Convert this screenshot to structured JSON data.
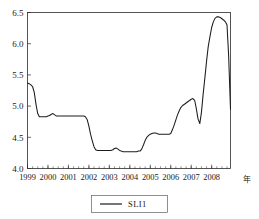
{
  "chart_data": {
    "type": "line",
    "title": "",
    "xlabel": "",
    "ylabel": "",
    "x_unit_label": "年",
    "ylim": [
      4.0,
      6.5
    ],
    "xlim": [
      1999.0,
      2008.92
    ],
    "grid": false,
    "legend_position": "bottom-center",
    "y_ticks": [
      "4.0",
      "4.5",
      "5.0",
      "5.5",
      "6.0",
      "6.5"
    ],
    "y_tick_values": [
      4.0,
      4.5,
      5.0,
      5.5,
      6.0,
      6.5
    ],
    "x_ticks": [
      "1999",
      "2000",
      "2001",
      "2002",
      "2003",
      "2004",
      "2005",
      "2006",
      "2007",
      "2008"
    ],
    "x_tick_values": [
      1999,
      2000,
      2001,
      2002,
      2003,
      2004,
      2005,
      2006,
      2007,
      2008
    ],
    "minor_tick_interval_months": 3,
    "series": [
      {
        "name": "SLI1",
        "color": "#1c1c1c",
        "x": [
          1999.0,
          1999.08,
          1999.17,
          1999.25,
          1999.33,
          1999.42,
          1999.5,
          1999.58,
          1999.67,
          1999.75,
          1999.83,
          1999.92,
          2000.0,
          2000.08,
          2000.17,
          2000.25,
          2000.33,
          2000.42,
          2000.5,
          2000.58,
          2000.67,
          2000.75,
          2000.83,
          2000.92,
          2001.0,
          2001.08,
          2001.17,
          2001.25,
          2001.33,
          2001.42,
          2001.5,
          2001.58,
          2001.67,
          2001.75,
          2001.83,
          2001.92,
          2002.0,
          2002.08,
          2002.17,
          2002.25,
          2002.33,
          2002.42,
          2002.5,
          2002.58,
          2002.67,
          2002.75,
          2002.83,
          2002.92,
          2003.0,
          2003.08,
          2003.17,
          2003.25,
          2003.33,
          2003.42,
          2003.5,
          2003.58,
          2003.67,
          2003.75,
          2003.83,
          2003.92,
          2004.0,
          2004.08,
          2004.17,
          2004.25,
          2004.33,
          2004.42,
          2004.5,
          2004.58,
          2004.67,
          2004.75,
          2004.83,
          2004.92,
          2005.0,
          2005.08,
          2005.17,
          2005.25,
          2005.33,
          2005.42,
          2005.5,
          2005.58,
          2005.67,
          2005.75,
          2005.83,
          2005.92,
          2006.0,
          2006.08,
          2006.17,
          2006.25,
          2006.33,
          2006.42,
          2006.5,
          2006.58,
          2006.67,
          2006.75,
          2006.83,
          2006.92,
          2007.0,
          2007.08,
          2007.17,
          2007.25,
          2007.33,
          2007.42,
          2007.5,
          2007.58,
          2007.67,
          2007.75,
          2007.83,
          2007.92,
          2008.0,
          2008.08,
          2008.17,
          2008.25,
          2008.33,
          2008.42,
          2008.5,
          2008.58,
          2008.67,
          2008.75,
          2008.83,
          2008.92
        ],
        "values": [
          5.37,
          5.36,
          5.34,
          5.31,
          5.22,
          5.02,
          4.88,
          4.83,
          4.83,
          4.83,
          4.83,
          4.83,
          4.84,
          4.85,
          4.87,
          4.88,
          4.86,
          4.84,
          4.84,
          4.84,
          4.84,
          4.84,
          4.84,
          4.84,
          4.84,
          4.84,
          4.84,
          4.84,
          4.84,
          4.84,
          4.84,
          4.84,
          4.84,
          4.84,
          4.83,
          4.78,
          4.68,
          4.55,
          4.44,
          4.35,
          4.3,
          4.29,
          4.29,
          4.29,
          4.29,
          4.29,
          4.29,
          4.29,
          4.29,
          4.29,
          4.3,
          4.32,
          4.33,
          4.31,
          4.29,
          4.28,
          4.27,
          4.27,
          4.27,
          4.27,
          4.27,
          4.27,
          4.27,
          4.27,
          4.27,
          4.28,
          4.28,
          4.31,
          4.38,
          4.45,
          4.5,
          4.53,
          4.55,
          4.56,
          4.57,
          4.57,
          4.56,
          4.55,
          4.55,
          4.55,
          4.55,
          4.55,
          4.55,
          4.55,
          4.56,
          4.62,
          4.7,
          4.78,
          4.86,
          4.93,
          4.98,
          5.01,
          5.03,
          5.05,
          5.07,
          5.09,
          5.11,
          5.12,
          5.09,
          4.96,
          4.8,
          4.72,
          4.9,
          5.18,
          5.46,
          5.72,
          5.95,
          6.12,
          6.26,
          6.35,
          6.41,
          6.43,
          6.43,
          6.42,
          6.4,
          6.38,
          6.35,
          6.3,
          5.8,
          4.95
        ]
      }
    ],
    "annotations": {
      "start_value": 5.37,
      "max_value": 6.43,
      "max_x": 2008.25,
      "min_value": 4.27,
      "min_x": 2004.0,
      "end_value": 4.95,
      "local_peak_2007": 5.12,
      "local_dip_2007": 4.72
    }
  },
  "legend": {
    "entries": [
      {
        "label": "SLI1",
        "color": "#1c1c1c"
      }
    ]
  }
}
